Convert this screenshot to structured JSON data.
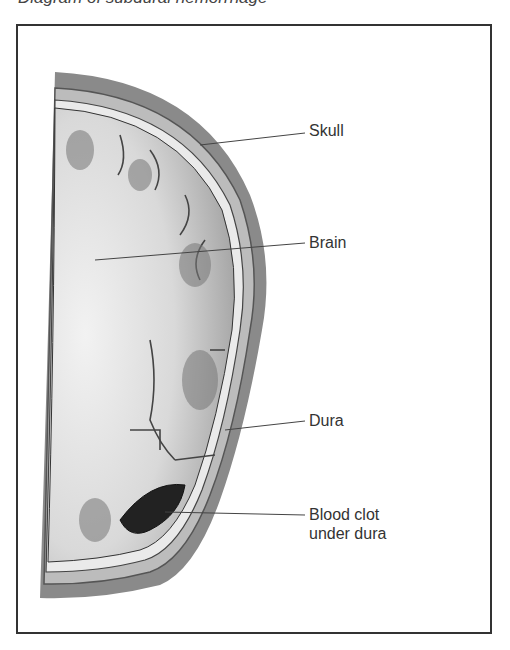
{
  "title": "Diagram of subdural hemorrhage",
  "figure": {
    "labels": [
      {
        "id": "skull",
        "text": "Skull"
      },
      {
        "id": "brain",
        "text": "Brain"
      },
      {
        "id": "dura",
        "text": "Dura"
      },
      {
        "id": "clot",
        "line1": "Blood clot",
        "line2": "under dura"
      }
    ]
  }
}
